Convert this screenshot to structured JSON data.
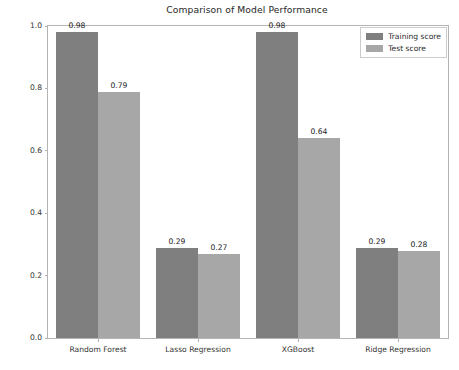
{
  "chart_data": {
    "type": "bar",
    "title": "Comparison of Model Performance",
    "xlabel": "",
    "ylabel": "R_square values",
    "categories": [
      "Random Forest",
      "Lasso Regression",
      "XGBoost",
      "Ridge Regression"
    ],
    "series": [
      {
        "name": "Training score",
        "color": "#7f7f7f",
        "values": [
          0.98,
          0.29,
          0.98,
          0.29
        ],
        "labels": [
          "0.98",
          "0.29",
          "0.98",
          "0.29"
        ]
      },
      {
        "name": "Test score",
        "color": "#a7a7a7",
        "values": [
          0.79,
          0.27,
          0.64,
          0.28
        ],
        "labels": [
          "0.79",
          "0.27",
          "0.64",
          "0.28"
        ]
      }
    ],
    "ylim": [
      0.0,
      1.0
    ],
    "yticks": [
      "0.0",
      "0.2",
      "0.4",
      "0.6",
      "0.8",
      "1.0"
    ],
    "ytick_values": [
      0.0,
      0.2,
      0.4,
      0.6,
      0.8,
      1.0
    ],
    "grid": false,
    "legend_position": "upper right"
  },
  "axes": {
    "spine_color": "#b4b4b4",
    "background": "#ffffff"
  }
}
